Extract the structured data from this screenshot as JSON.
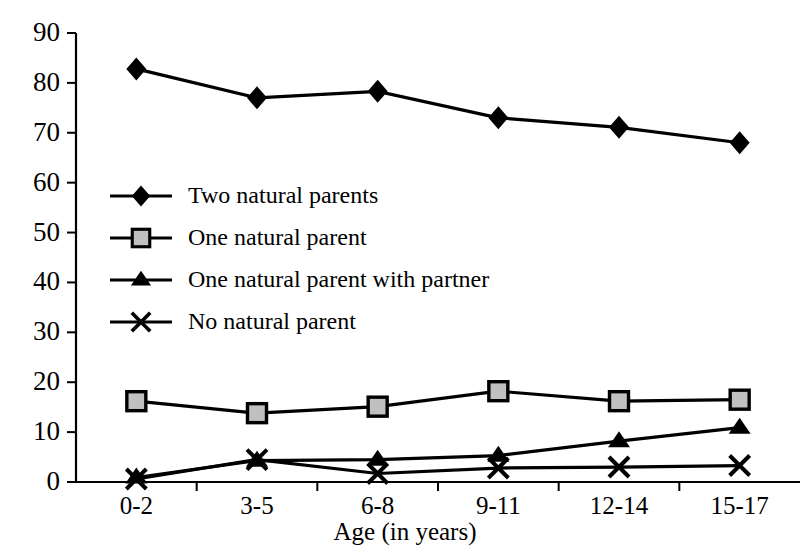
{
  "chart_data": {
    "type": "line",
    "title": "",
    "xlabel": "Age (in years)",
    "ylabel": "",
    "categories": [
      "0-2",
      "3-5",
      "6-8",
      "9-11",
      "12-14",
      "15-17"
    ],
    "ylim": [
      0,
      90
    ],
    "ytick_step": 10,
    "yticks": [
      0,
      10,
      20,
      30,
      40,
      50,
      60,
      70,
      80,
      90
    ],
    "grid": false,
    "legend_position": "inside-upper-left",
    "series": [
      {
        "name": "Two natural parents",
        "marker": "diamond",
        "color": "#000000",
        "values": [
          82.8,
          77.0,
          78.3,
          73.0,
          71.1,
          68.0
        ]
      },
      {
        "name": "One natural parent",
        "marker": "square",
        "color": "#000000",
        "fill": "#c0c0c0",
        "values": [
          16.2,
          13.8,
          15.1,
          18.2,
          16.2,
          16.5
        ]
      },
      {
        "name": "One natural parent with partner",
        "marker": "triangle",
        "color": "#000000",
        "values": [
          0.9,
          4.3,
          4.5,
          5.3,
          8.2,
          10.9
        ]
      },
      {
        "name": "No natural parent",
        "marker": "cross",
        "color": "#000000",
        "values": [
          0.6,
          4.5,
          1.7,
          2.8,
          3.0,
          3.3
        ]
      }
    ]
  },
  "axis": {
    "y_tick_labels": [
      "90",
      "80",
      "70",
      "60",
      "50",
      "40",
      "30",
      "20",
      "10",
      "0"
    ],
    "x_tick_labels": [
      "0-2",
      "3-5",
      "6-8",
      "9-11",
      "12-14",
      "15-17"
    ],
    "x_axis_title": "Age (in years)"
  },
  "legend": {
    "entries": [
      {
        "label": "Two natural parents",
        "marker": "diamond"
      },
      {
        "label": "One natural parent",
        "marker": "square"
      },
      {
        "label": "One natural parent with partner",
        "marker": "triangle"
      },
      {
        "label": "No natural parent",
        "marker": "cross"
      }
    ]
  }
}
